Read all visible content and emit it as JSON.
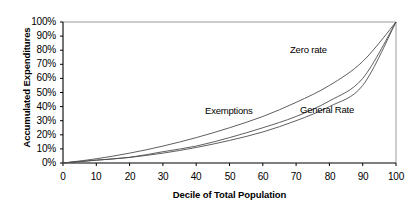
{
  "chart_data": {
    "type": "line",
    "title": "",
    "xlabel": "Decile of Total Population",
    "ylabel": "Accumulated Expenditures",
    "xlim": [
      0,
      100
    ],
    "ylim": [
      0,
      100
    ],
    "grid": false,
    "legend_position": "inline-annotations",
    "x_ticks": [
      "0",
      "10",
      "20",
      "30",
      "40",
      "50",
      "60",
      "70",
      "80",
      "90",
      "100"
    ],
    "y_ticks": [
      "0%",
      "10%",
      "20%",
      "30%",
      "40%",
      "50%",
      "60%",
      "70%",
      "80%",
      "90%",
      "100%"
    ],
    "x": [
      0,
      10,
      20,
      30,
      40,
      50,
      60,
      70,
      80,
      90,
      100
    ],
    "series": [
      {
        "name": "Zero rate",
        "values": [
          0,
          3,
          7,
          12,
          18,
          25,
          33,
          43,
          55,
          72,
          100
        ],
        "color": "#4d4d4d",
        "label_x": 63,
        "label_y": 40
      },
      {
        "name": "Exemptions",
        "values": [
          0,
          2,
          4,
          8,
          12,
          18,
          25,
          33,
          44,
          60,
          100
        ],
        "color": "#4d4d4d",
        "label_x": 42,
        "label_y": 29
      },
      {
        "name": "General Rate",
        "values": [
          0,
          2,
          4,
          7,
          11,
          16,
          22,
          30,
          40,
          55,
          100
        ],
        "color": "#4d4d4d",
        "label_x": 70,
        "label_y": 28
      }
    ]
  },
  "axes": {
    "y_title": "Accumulated Expenditures",
    "x_title": "Decile of Total Population",
    "y_labels": [
      "100%",
      "90%",
      "80%",
      "70%",
      "60%",
      "50%",
      "40%",
      "30%",
      "20%",
      "10%",
      "0%"
    ],
    "x_labels": [
      "0",
      "10",
      "20",
      "30",
      "40",
      "50",
      "60",
      "70",
      "80",
      "90",
      "100"
    ]
  },
  "annotations": {
    "zero_rate": "Zero rate",
    "exemptions": "Exemptions",
    "general_rate": "General Rate"
  },
  "colors": {
    "line": "#4d4d4d",
    "axis": "#000000",
    "frame": "#808080",
    "text": "#000000"
  }
}
